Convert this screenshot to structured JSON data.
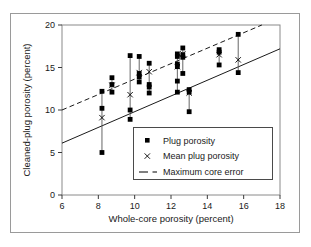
{
  "chart_data": {
    "type": "scatter",
    "title": "",
    "xlabel": "Whole-core porosity (percent)",
    "ylabel": "Cleaned-plug porosity (percent)",
    "xlim": [
      6,
      18
    ],
    "ylim": [
      0,
      20
    ],
    "xticks": [
      6,
      8,
      10,
      12,
      14,
      16,
      18
    ],
    "yticks": [
      0,
      5,
      10,
      15,
      20
    ],
    "xtick_labels": [
      "6",
      "8",
      "10",
      "12",
      "14",
      "16",
      "18"
    ],
    "ytick_labels": [
      "0",
      "5",
      "10",
      "15",
      "20"
    ],
    "grid": false,
    "legend_position": "lower right",
    "legend_entries": [
      {
        "marker": "square",
        "label": "Plug porosity"
      },
      {
        "marker": "x",
        "label": "Mean plug porosity"
      },
      {
        "marker": "dashed-line",
        "label": "Maximum core error"
      }
    ],
    "series": [
      {
        "name": "Plug porosity",
        "marker": "filled-square",
        "color": "#000000",
        "groups": [
          {
            "x": 8.2,
            "values": [
              12.2,
              10.2,
              5.0
            ],
            "mean": 9.1,
            "range": [
              5.0,
              12.2
            ]
          },
          {
            "x": 8.75,
            "values": [
              13.8,
              13.0,
              12.1
            ],
            "mean": 12.9,
            "range": [
              12.1,
              13.8
            ]
          },
          {
            "x": 9.75,
            "values": [
              16.4,
              10.0,
              8.9
            ],
            "mean": 11.8,
            "range": [
              8.9,
              16.4
            ]
          },
          {
            "x": 10.25,
            "values": [
              16.3,
              14.3,
              13.9,
              13.3
            ],
            "mean": 14.4,
            "range": [
              13.3,
              16.3
            ]
          },
          {
            "x": 10.8,
            "values": [
              15.5,
              13.0,
              12.7,
              12.0
            ],
            "mean": 14.5,
            "range": [
              11.9,
              15.5
            ]
          },
          {
            "x": 12.35,
            "values": [
              16.6,
              16.3,
              15.4,
              15.1,
              13.4,
              12.1
            ],
            "mean": 15.1,
            "range": [
              12.1,
              16.6
            ]
          },
          {
            "x": 12.65,
            "values": [
              17.3,
              16.5,
              16.2,
              14.3
            ],
            "mean": 16.6,
            "range": [
              14.3,
              17.3
            ]
          },
          {
            "x": 13.0,
            "values": [
              12.4,
              12.1,
              9.8
            ],
            "mean": 12.0,
            "range": [
              9.8,
              12.4
            ]
          },
          {
            "x": 14.65,
            "values": [
              17.1,
              16.8,
              15.3
            ],
            "mean": 16.5,
            "range": [
              15.3,
              17.1
            ]
          },
          {
            "x": 15.7,
            "values": [
              18.9,
              14.4
            ],
            "mean": 15.9,
            "range": [
              14.4,
              18.9
            ]
          }
        ]
      },
      {
        "name": "Mean plug porosity",
        "marker": "x",
        "color": "#000000",
        "points": [
          {
            "x": 8.2,
            "y": 9.1
          },
          {
            "x": 8.75,
            "y": 12.9
          },
          {
            "x": 9.75,
            "y": 11.8
          },
          {
            "x": 10.25,
            "y": 14.4
          },
          {
            "x": 10.8,
            "y": 14.5
          },
          {
            "x": 12.35,
            "y": 15.1
          },
          {
            "x": 12.65,
            "y": 16.6
          },
          {
            "x": 13.0,
            "y": 12.0
          },
          {
            "x": 14.65,
            "y": 16.5
          },
          {
            "x": 15.7,
            "y": 15.9
          }
        ]
      },
      {
        "name": "Maximum core error",
        "style": "dashed",
        "color": "#000000",
        "line": {
          "x1": 6,
          "y1": 10.0,
          "x2": 17.0,
          "y2": 20.0
        }
      },
      {
        "name": "Lower bound line",
        "style": "solid",
        "color": "#000000",
        "line": {
          "x1": 6,
          "y1": 6.1,
          "x2": 18,
          "y2": 17.2
        }
      }
    ]
  },
  "legend": {
    "plug_label": "Plug porosity",
    "mean_label": "Mean plug porosity",
    "error_label": "Maximum core error"
  },
  "axes": {
    "x_title": "Whole-core porosity (percent)",
    "y_title": "Cleaned-plug porosity (percent)",
    "x_ticks": [
      "6",
      "8",
      "10",
      "12",
      "14",
      "16",
      "18"
    ],
    "y_ticks": [
      "0",
      "5",
      "10",
      "15",
      "20"
    ]
  }
}
